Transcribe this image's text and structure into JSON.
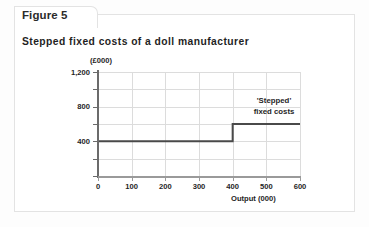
{
  "figure": {
    "tab_label": "Figure 5",
    "title": "Stepped fixed costs of a doll manufacturer"
  },
  "chart_data": {
    "type": "line",
    "subtype": "step",
    "title": "Stepped fixed costs of a doll manufacturer",
    "xlabel": "Output (000)",
    "ylabel": "(£000)",
    "xlim": [
      0,
      600
    ],
    "ylim": [
      0,
      1200
    ],
    "grid": true,
    "legend": "none",
    "x_ticks": [
      0,
      100,
      200,
      300,
      400,
      500,
      600
    ],
    "x_tick_labels": [
      "0",
      "100",
      "200",
      "300",
      "400",
      "500",
      "600"
    ],
    "y_ticks": [
      0,
      200,
      400,
      600,
      800,
      1000,
      1200
    ],
    "y_tick_labels": [
      "",
      "",
      "400",
      "",
      "800",
      "",
      "1,200"
    ],
    "y_major_labels": [
      "400",
      "800",
      "1,200"
    ],
    "series": [
      {
        "name": "'Stepped' fixed costs",
        "color": "#4a4a4a",
        "step": "post",
        "points": [
          {
            "x": 0,
            "y": 400
          },
          {
            "x": 400,
            "y": 400
          },
          {
            "x": 400,
            "y": 600
          },
          {
            "x": 600,
            "y": 600
          }
        ]
      }
    ],
    "annotations": [
      {
        "name": "stepped-fixed-costs-label",
        "line1": "'Stepped'",
        "line2": "fixed costs",
        "x": 520,
        "y": 790
      }
    ]
  },
  "colors": {
    "series_line": "#4a4a4a",
    "gridline": "#dcdcdc",
    "axis": "#6b6b6b",
    "panel_border": "#e3e3e3",
    "text": "#1f1f1f"
  }
}
